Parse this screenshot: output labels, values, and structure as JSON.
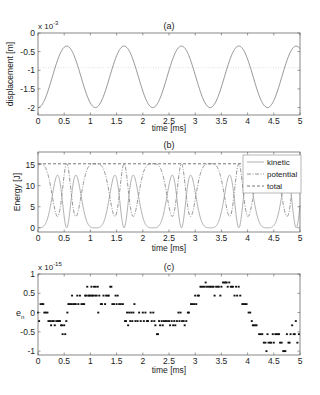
{
  "figure": {
    "xlabel": "time [ms]"
  },
  "chart_data": [
    {
      "id": "a",
      "type": "line",
      "title": "(a)",
      "xlabel": "time [ms]",
      "ylabel": "displacement [m]",
      "y_multiplier": "x 10",
      "y_exponent": "-3",
      "xlim": [
        0,
        5
      ],
      "ylim": [
        -2.2,
        0
      ],
      "xticks": [
        "0",
        "0.5",
        "1",
        "1.5",
        "2",
        "2.5",
        "3",
        "3.5",
        "4",
        "4.5",
        "5"
      ],
      "yticks": [
        0,
        -0.5,
        -1,
        -1.5,
        -2
      ],
      "ytick_labels": [
        "0",
        "-0.5",
        "-1",
        "-1.5",
        "-2"
      ],
      "grid": false,
      "series": [
        {
          "name": "displacement",
          "style": "solid",
          "color": "#7a7a7a",
          "description": "periodic oscillation, period ~1.09 ms, min -2.0e-3 at t=0,1.1,2.2,3.3,4.4; max -0.35e-3 at t=0.55,1.65,2.75,3.85,4.95",
          "period": 1.095,
          "min": -2.0,
          "max": -0.35
        },
        {
          "name": "equilibrium",
          "style": "dotted",
          "color": "#d8d8d8",
          "y": -0.93
        }
      ]
    },
    {
      "id": "b",
      "type": "line",
      "title": "(b)",
      "xlabel": "time [ms]",
      "ylabel": "Energy [J]",
      "xlim": [
        0,
        5
      ],
      "ylim": [
        -1,
        18
      ],
      "xticks": [
        "0",
        "0.5",
        "1",
        "1.5",
        "2",
        "2.5",
        "3",
        "3.5",
        "4",
        "4.5",
        "5"
      ],
      "yticks": [
        0,
        5,
        10,
        15
      ],
      "ytick_labels": [
        "0",
        "5",
        "10",
        "15"
      ],
      "grid": false,
      "legend": {
        "position": "upper right",
        "entries": [
          "kinetic",
          "potential",
          "total"
        ]
      },
      "series": [
        {
          "name": "kinetic",
          "style": "solid",
          "color": "#9a9a9a",
          "peaks": 12.5,
          "zeros_at": [
            0,
            0.55,
            1.1,
            1.65,
            2.2,
            2.75,
            3.3,
            3.85,
            4.4,
            4.95
          ]
        },
        {
          "name": "potential",
          "style": "dashdot",
          "color": "#777777",
          "peaks": 15,
          "min": 2.5
        },
        {
          "name": "total",
          "style": "dashed",
          "color": "#555555",
          "y": 15.2
        }
      ]
    },
    {
      "id": "c",
      "type": "scatter",
      "title": "(c)",
      "xlabel": "time [ms]",
      "ylabel": "e_n",
      "y_multiplier": "x 10",
      "y_exponent": "-15",
      "xlim": [
        0,
        5
      ],
      "ylim": [
        -1.1,
        1
      ],
      "xticks": [
        "0",
        "0.5",
        "1",
        "1.5",
        "2",
        "2.5",
        "3",
        "3.5",
        "4",
        "4.5",
        "5"
      ],
      "yticks": [
        1,
        0.5,
        0,
        -0.5,
        -1
      ],
      "ytick_labels": [
        "1",
        "0.5",
        "0",
        "-0.5",
        "-1"
      ],
      "grid": false,
      "points": [
        [
          0.0,
          0.0
        ],
        [
          0.02,
          -0.22
        ],
        [
          0.05,
          0.22
        ],
        [
          0.08,
          0.22
        ],
        [
          0.1,
          0.22
        ],
        [
          0.12,
          0.0
        ],
        [
          0.15,
          0.0
        ],
        [
          0.18,
          0.0
        ],
        [
          0.2,
          -0.22
        ],
        [
          0.23,
          -0.22
        ],
        [
          0.25,
          -0.33
        ],
        [
          0.27,
          -0.22
        ],
        [
          0.3,
          -0.22
        ],
        [
          0.32,
          -0.33
        ],
        [
          0.35,
          -0.22
        ],
        [
          0.38,
          -0.22
        ],
        [
          0.4,
          -0.22
        ],
        [
          0.42,
          -0.22
        ],
        [
          0.44,
          -0.33
        ],
        [
          0.46,
          -0.33
        ],
        [
          0.47,
          -0.56
        ],
        [
          0.5,
          -0.33
        ],
        [
          0.52,
          -0.56
        ],
        [
          0.54,
          -0.22
        ],
        [
          0.56,
          0.0
        ],
        [
          0.58,
          0.22
        ],
        [
          0.6,
          0.22
        ],
        [
          0.63,
          0.22
        ],
        [
          0.65,
          0.44
        ],
        [
          0.67,
          0.22
        ],
        [
          0.7,
          0.22
        ],
        [
          0.72,
          0.22
        ],
        [
          0.75,
          0.44
        ],
        [
          0.77,
          0.22
        ],
        [
          0.8,
          0.44
        ],
        [
          0.83,
          0.22
        ],
        [
          0.86,
          0.22
        ],
        [
          0.88,
          0.22
        ],
        [
          0.9,
          0.44
        ],
        [
          0.92,
          0.44
        ],
        [
          0.94,
          0.67
        ],
        [
          0.96,
          0.44
        ],
        [
          0.98,
          0.44
        ],
        [
          1.0,
          0.44
        ],
        [
          1.02,
          0.67
        ],
        [
          1.03,
          0.44
        ],
        [
          1.05,
          0.44
        ],
        [
          1.07,
          0.67
        ],
        [
          1.09,
          0.44
        ],
        [
          1.1,
          0.67
        ],
        [
          1.12,
          0.44
        ],
        [
          1.14,
          0.67
        ],
        [
          1.15,
          0.0
        ],
        [
          1.17,
          0.44
        ],
        [
          1.2,
          0.22
        ],
        [
          1.22,
          0.22
        ],
        [
          1.25,
          0.44
        ],
        [
          1.28,
          0.22
        ],
        [
          1.3,
          0.44
        ],
        [
          1.33,
          0.44
        ],
        [
          1.35,
          0.44
        ],
        [
          1.38,
          0.67
        ],
        [
          1.4,
          0.67
        ],
        [
          1.42,
          0.22
        ],
        [
          1.45,
          0.22
        ],
        [
          1.48,
          0.44
        ],
        [
          1.5,
          0.22
        ],
        [
          1.52,
          0.44
        ],
        [
          1.55,
          0.22
        ],
        [
          1.58,
          0.22
        ],
        [
          1.62,
          0.22
        ],
        [
          1.66,
          -0.22
        ],
        [
          1.68,
          -0.22
        ],
        [
          1.7,
          0.0
        ],
        [
          1.72,
          -0.33
        ],
        [
          1.74,
          0.0
        ],
        [
          1.76,
          -0.22
        ],
        [
          1.78,
          0.0
        ],
        [
          1.8,
          -0.22
        ],
        [
          1.82,
          0.0
        ],
        [
          1.84,
          0.22
        ],
        [
          1.86,
          -0.22
        ],
        [
          1.9,
          -0.22
        ],
        [
          1.93,
          0.0
        ],
        [
          1.96,
          -0.22
        ],
        [
          2.0,
          0.0
        ],
        [
          2.02,
          -0.22
        ],
        [
          2.05,
          0.0
        ],
        [
          2.08,
          -0.22
        ],
        [
          2.1,
          -0.22
        ],
        [
          2.15,
          0.0
        ],
        [
          2.17,
          -0.22
        ],
        [
          2.2,
          0.0
        ],
        [
          2.22,
          -0.22
        ],
        [
          2.24,
          -0.33
        ],
        [
          2.27,
          -0.56
        ],
        [
          2.29,
          -0.56
        ],
        [
          2.31,
          -0.22
        ],
        [
          2.33,
          -0.33
        ],
        [
          2.36,
          -0.22
        ],
        [
          2.38,
          -0.33
        ],
        [
          2.4,
          -0.22
        ],
        [
          2.43,
          -0.22
        ],
        [
          2.46,
          -0.22
        ],
        [
          2.5,
          -0.22
        ],
        [
          2.52,
          -0.33
        ],
        [
          2.55,
          -0.22
        ],
        [
          2.58,
          -0.33
        ],
        [
          2.6,
          -0.22
        ],
        [
          2.62,
          -0.33
        ],
        [
          2.65,
          -0.22
        ],
        [
          2.68,
          0.0
        ],
        [
          2.7,
          -0.22
        ],
        [
          2.72,
          0.0
        ],
        [
          2.75,
          -0.22
        ],
        [
          2.78,
          -0.22
        ],
        [
          2.8,
          -0.33
        ],
        [
          2.83,
          -0.22
        ],
        [
          2.86,
          0.0
        ],
        [
          2.88,
          0.0
        ],
        [
          2.92,
          0.22
        ],
        [
          2.95,
          0.22
        ],
        [
          2.98,
          0.22
        ],
        [
          3.0,
          0.44
        ],
        [
          3.02,
          0.22
        ],
        [
          3.05,
          0.44
        ],
        [
          3.07,
          0.44
        ],
        [
          3.1,
          0.67
        ],
        [
          3.12,
          0.67
        ],
        [
          3.15,
          0.67
        ],
        [
          3.18,
          0.67
        ],
        [
          3.2,
          0.78
        ],
        [
          3.22,
          0.67
        ],
        [
          3.25,
          0.67
        ],
        [
          3.28,
          0.67
        ],
        [
          3.3,
          0.67
        ],
        [
          3.33,
          0.67
        ],
        [
          3.35,
          0.67
        ],
        [
          3.37,
          0.44
        ],
        [
          3.4,
          0.67
        ],
        [
          3.43,
          0.67
        ],
        [
          3.45,
          0.67
        ],
        [
          3.48,
          0.44
        ],
        [
          3.5,
          0.67
        ],
        [
          3.53,
          0.78
        ],
        [
          3.56,
          0.78
        ],
        [
          3.58,
          0.78
        ],
        [
          3.6,
          0.78
        ],
        [
          3.62,
          0.67
        ],
        [
          3.65,
          0.78
        ],
        [
          3.68,
          0.67
        ],
        [
          3.7,
          0.67
        ],
        [
          3.72,
          0.67
        ],
        [
          3.75,
          0.44
        ],
        [
          3.78,
          0.67
        ],
        [
          3.8,
          0.44
        ],
        [
          3.83,
          0.67
        ],
        [
          3.86,
          0.44
        ],
        [
          3.9,
          0.22
        ],
        [
          3.92,
          0.22
        ],
        [
          3.95,
          0.22
        ],
        [
          3.98,
          0.22
        ],
        [
          4.02,
          0.0
        ],
        [
          4.05,
          0.0
        ],
        [
          4.08,
          -0.22
        ],
        [
          4.1,
          -0.33
        ],
        [
          4.12,
          -0.33
        ],
        [
          4.15,
          -0.33
        ],
        [
          4.17,
          -0.33
        ],
        [
          4.22,
          -0.56
        ],
        [
          4.25,
          -0.56
        ],
        [
          4.28,
          -0.56
        ],
        [
          4.31,
          -0.78
        ],
        [
          4.34,
          -0.78
        ],
        [
          4.36,
          -1.0
        ],
        [
          4.38,
          -0.56
        ],
        [
          4.4,
          -0.78
        ],
        [
          4.43,
          -0.78
        ],
        [
          4.45,
          -0.78
        ],
        [
          4.48,
          -0.56
        ],
        [
          4.5,
          -0.78
        ],
        [
          4.53,
          -0.56
        ],
        [
          4.55,
          -0.56
        ],
        [
          4.58,
          -0.56
        ],
        [
          4.6,
          -0.56
        ],
        [
          4.62,
          -0.78
        ],
        [
          4.65,
          -0.78
        ],
        [
          4.68,
          -1.0
        ],
        [
          4.7,
          -1.0
        ],
        [
          4.72,
          -1.0
        ],
        [
          4.75,
          -0.56
        ],
        [
          4.78,
          -0.78
        ],
        [
          4.8,
          -0.78
        ],
        [
          4.82,
          -0.56
        ],
        [
          4.85,
          -0.33
        ],
        [
          4.88,
          -0.56
        ],
        [
          4.9,
          -0.56
        ],
        [
          4.92,
          -0.22
        ],
        [
          4.95,
          -0.78
        ],
        [
          4.98,
          -0.56
        ]
      ]
    }
  ]
}
